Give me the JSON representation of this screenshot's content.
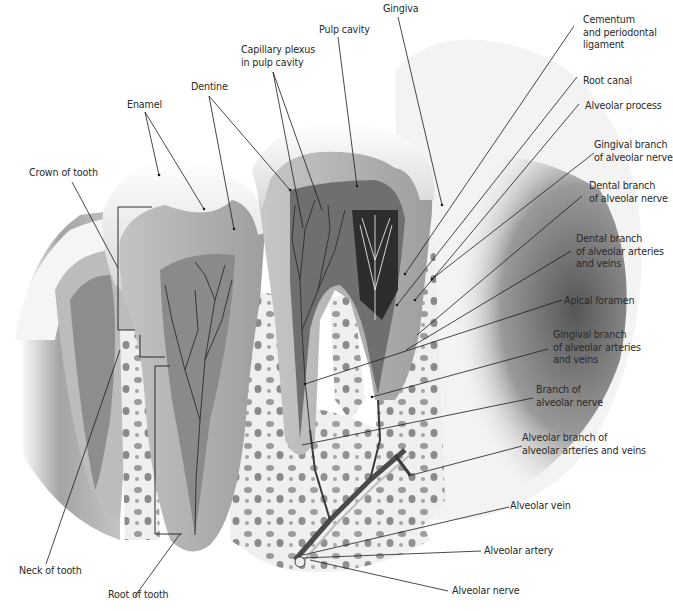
{
  "figure": {
    "labels_left": {
      "crown_of_tooth": "Crown of tooth",
      "enamel": "Enamel",
      "dentine": "Dentine",
      "capillary_plexus": "Capillary plexus\nin pulp cavity",
      "pulp_cavity": "Pulp cavity",
      "gingiva": "Gingiva",
      "neck_of_tooth": "Neck of tooth",
      "root_of_tooth": "Root of tooth"
    },
    "labels_right": {
      "cementum": "Cementum\nand periodontal\nligament",
      "root_canal": "Root canal",
      "alveolar_process": "Alveolar process",
      "gingival_branch_nerve": "Gingival branch\nof alveolar nerve",
      "dental_branch_nerve": "Dental branch\nof alveolar nerve",
      "dental_branch_arteries": "Dental branch\nof alveolar arteries\nand veins",
      "apical_foramen": "Apical foramen",
      "gingival_branch_arteries": "Gingival branch\nof alveolar arteries\nand veins",
      "branch_alveolar_nerve": "Branch of\nalveolar nerve",
      "alveolar_branch_arteries": "Alveolar branch of\nalveolar arteries and veins",
      "alveolar_vein": "Alveolar vein",
      "alveolar_artery": "Alveolar artery",
      "alveolar_nerve": "Alveolar nerve"
    },
    "colors": {
      "enamel": "#f2f2f2",
      "dentine": "#b9b9b9",
      "pulp": "#7a7a7a",
      "bone": "#ececec",
      "gum": "#6e6e6e",
      "leader_line": "#1a1a1a",
      "text": "#2a2a2a"
    }
  }
}
